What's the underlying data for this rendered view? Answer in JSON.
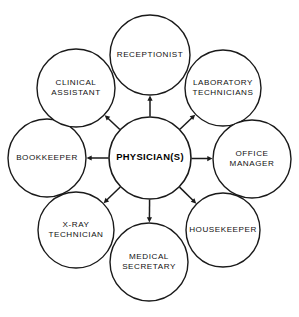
{
  "diagram": {
    "type": "hub-and-spoke",
    "background_color": "#ffffff",
    "stroke_color": "#1a1a1a",
    "text_color": "#111111",
    "hub": {
      "id": "physicians",
      "label": "PHYSICIAN(S)",
      "lines": [
        "PHYSICIAN(S)"
      ],
      "cx": 150,
      "cy": 158,
      "r": 41
    },
    "nodes": [
      {
        "id": "receptionist",
        "label": "RECEPTIONIST",
        "lines": [
          "RECEPTIONIST"
        ],
        "cx": 150,
        "cy": 55,
        "r": 40,
        "angle_deg": 90
      },
      {
        "id": "laboratory-technicians",
        "label": "LABORATORY TECHNICIANS",
        "lines": [
          "LABORATORY",
          "TECHNICIANS"
        ],
        "cx": 223,
        "cy": 88,
        "r": 38,
        "angle_deg": 45
      },
      {
        "id": "office-manager",
        "label": "OFFICE MANAGER",
        "lines": [
          "OFFICE",
          "MANAGER"
        ],
        "cx": 252,
        "cy": 159,
        "r": 39,
        "angle_deg": 0
      },
      {
        "id": "housekeeper",
        "label": "HOUSEKEEPER",
        "lines": [
          "HOUSEKEEPER"
        ],
        "cx": 223,
        "cy": 230,
        "r": 37,
        "angle_deg": -45
      },
      {
        "id": "medical-secretary",
        "label": "MEDICAL SECRETARY",
        "lines": [
          "MEDICAL",
          "SECRETARY"
        ],
        "cx": 149,
        "cy": 262,
        "r": 39,
        "angle_deg": -90
      },
      {
        "id": "x-ray-technician",
        "label": "X-RAY TECHNICIAN",
        "lines": [
          "X-RAY",
          "TECHNICIAN"
        ],
        "cx": 76,
        "cy": 230,
        "r": 38,
        "angle_deg": -135
      },
      {
        "id": "bookkeeper",
        "label": "BOOKKEEPER",
        "lines": [
          "BOOKKEEPER"
        ],
        "cx": 47,
        "cy": 158,
        "r": 39,
        "angle_deg": 180
      },
      {
        "id": "clinical-assistant",
        "label": "CLINICAL ASSISTANT",
        "lines": [
          "CLINICAL",
          "ASSISTANT"
        ],
        "cx": 76,
        "cy": 88,
        "r": 39,
        "angle_deg": 135
      }
    ],
    "connections": [
      {
        "id": "conn-receptionist",
        "from": "physicians",
        "to": "receptionist",
        "arrow": "to"
      },
      {
        "id": "conn-laboratory-technicians",
        "from": "physicians",
        "to": "laboratory-technicians",
        "arrow": "to"
      },
      {
        "id": "conn-office-manager",
        "from": "physicians",
        "to": "office-manager",
        "arrow": "to"
      },
      {
        "id": "conn-housekeeper",
        "from": "physicians",
        "to": "housekeeper",
        "arrow": "to"
      },
      {
        "id": "conn-medical-secretary",
        "from": "physicians",
        "to": "medical-secretary",
        "arrow": "to"
      },
      {
        "id": "conn-x-ray-technician",
        "from": "physicians",
        "to": "x-ray-technician",
        "arrow": "to"
      },
      {
        "id": "conn-bookkeeper",
        "from": "physicians",
        "to": "bookkeeper",
        "arrow": "to"
      },
      {
        "id": "conn-clinical-assistant",
        "from": "physicians",
        "to": "clinical-assistant",
        "arrow": "to"
      }
    ]
  }
}
